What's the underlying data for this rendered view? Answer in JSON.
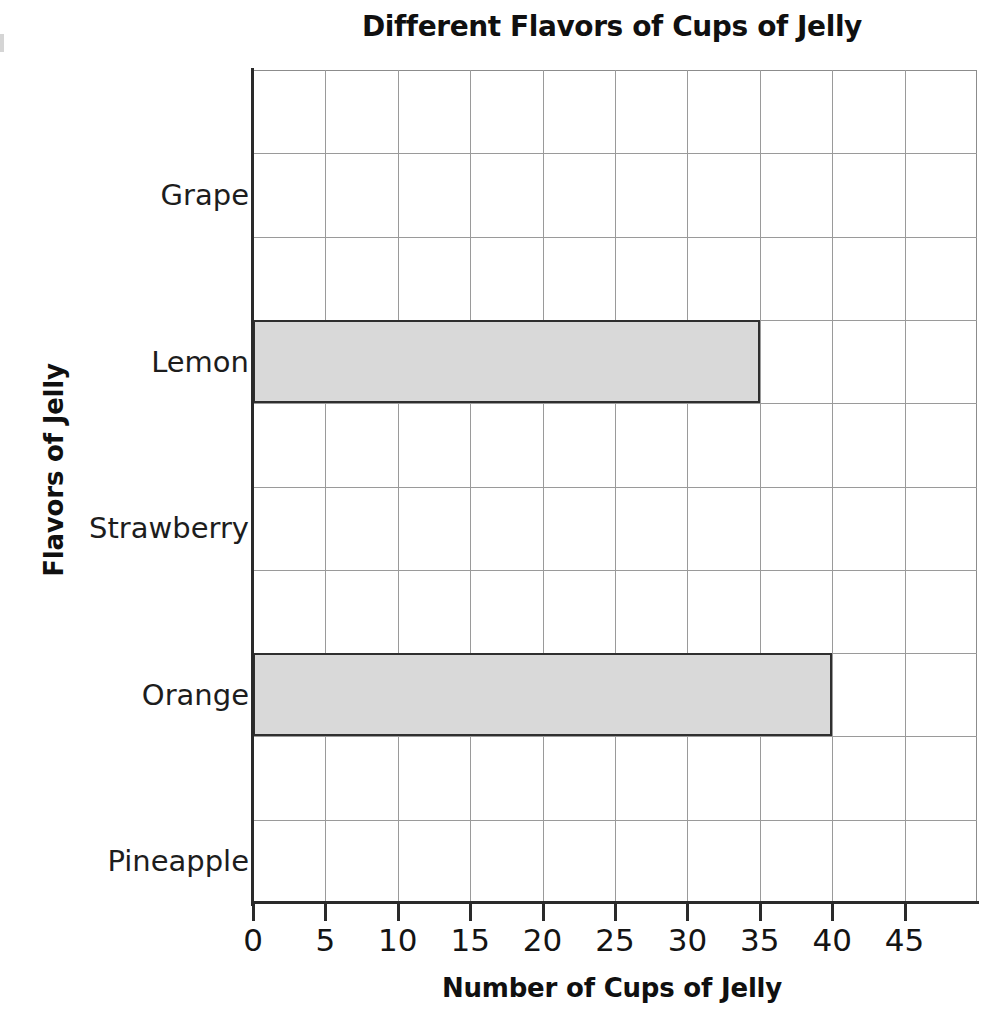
{
  "chart_data": {
    "type": "bar",
    "orientation": "horizontal",
    "title": "Different Flavors of Cups of Jelly",
    "xlabel": "Number of Cups of Jelly",
    "ylabel": "Flavors of Jelly",
    "categories": [
      "Grape",
      "Lemon",
      "Strawberry",
      "Orange",
      "Pineapple"
    ],
    "values": [
      0,
      35,
      0,
      40,
      0
    ],
    "xlim": [
      0,
      50
    ],
    "xticks": [
      0,
      5,
      10,
      15,
      20,
      25,
      30,
      35,
      40,
      45
    ],
    "xtick_labels": [
      "0",
      "5",
      "10",
      "15",
      "20",
      "25",
      "30",
      "35",
      "40",
      "45"
    ],
    "grid": true,
    "legend": "none",
    "bar_fill_color": "#d9d9d9",
    "bar_border_color": "#2f2f2f",
    "gridline_color": "#9a9a9a",
    "axis_color": "#2a2a2a",
    "background_color": "#ffffff"
  }
}
